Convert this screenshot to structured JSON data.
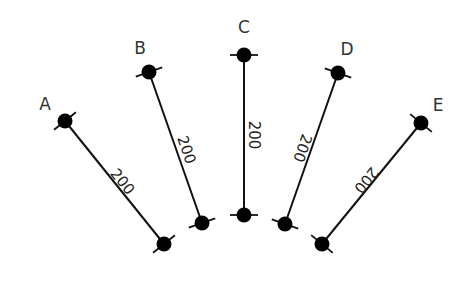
{
  "diagram": {
    "colors": {
      "line": "#111111",
      "node": "#000000",
      "label": "#333333",
      "background": "#ffffff"
    },
    "members": [
      {
        "id": "A",
        "label": "A",
        "length_label": "200",
        "top": [
          65,
          121
        ],
        "bottom": [
          164,
          244
        ],
        "label_pos": [
          45,
          110
        ],
        "dim_pos": [
          122,
          182
        ]
      },
      {
        "id": "B",
        "label": "B",
        "length_label": "200",
        "top": [
          149,
          72
        ],
        "bottom": [
          202,
          223
        ],
        "label_pos": [
          140,
          54
        ],
        "dim_pos": [
          186,
          150
        ]
      },
      {
        "id": "C",
        "label": "C",
        "length_label": "200",
        "top": [
          244,
          55
        ],
        "bottom": [
          244,
          215
        ],
        "label_pos": [
          244,
          33
        ],
        "dim_pos": [
          253,
          135
        ]
      },
      {
        "id": "D",
        "label": "D",
        "length_label": "200",
        "top": [
          338,
          73
        ],
        "bottom": [
          285,
          224
        ],
        "label_pos": [
          347,
          55
        ],
        "dim_pos": [
          302,
          148
        ]
      },
      {
        "id": "E",
        "label": "E",
        "length_label": "200",
        "top": [
          421,
          123
        ],
        "bottom": [
          322,
          244
        ],
        "label_pos": [
          438,
          111
        ],
        "dim_pos": [
          366,
          180
        ]
      }
    ]
  }
}
